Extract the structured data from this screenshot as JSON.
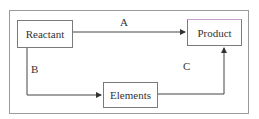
{
  "diagram": {
    "nodes": [
      {
        "id": "reactant",
        "label": "Reactant"
      },
      {
        "id": "product",
        "label": "Product"
      },
      {
        "id": "elements",
        "label": "Elements"
      }
    ],
    "edges": [
      {
        "from": "reactant",
        "to": "product",
        "label": "A"
      },
      {
        "from": "reactant",
        "to": "elements",
        "label": "B"
      },
      {
        "from": "elements",
        "to": "product",
        "label": "C"
      }
    ]
  }
}
